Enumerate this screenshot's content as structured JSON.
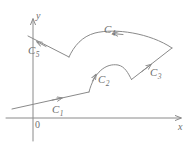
{
  "figure": {
    "kind": "math-diagram",
    "stroke_color": "#8a8a8a",
    "label_color": "#6e6e6e",
    "background_color": "#ffffff"
  },
  "axes": {
    "x_label": "x",
    "y_label": "y",
    "origin_label": "0",
    "x_axis": {
      "y": 118,
      "x_start": 6,
      "x_end": 184,
      "arrow": "right"
    },
    "y_axis": {
      "x": 33,
      "y_start": 140,
      "y_end": 16,
      "arrow": "up"
    }
  },
  "curves": [
    {
      "id": "C1",
      "label": "C",
      "subscript": "1",
      "shape": "line",
      "arrow_direction": "right",
      "points": [
        [
          12,
          108
        ],
        [
          89,
          92
        ]
      ]
    },
    {
      "id": "C2",
      "label": "C",
      "subscript": "2",
      "shape": "arc",
      "arrow_direction": "right",
      "points": [
        [
          89,
          92
        ],
        [
          103,
          66
        ],
        [
          123,
          64
        ],
        [
          131,
          79
        ]
      ]
    },
    {
      "id": "C3",
      "label": "C",
      "subscript": "3",
      "shape": "line",
      "arrow_direction": "up-right",
      "points": [
        [
          131,
          79
        ],
        [
          172,
          48
        ]
      ]
    },
    {
      "id": "C4",
      "label": "C",
      "subscript": "4",
      "shape": "arc",
      "arrow_direction": "left",
      "points": [
        [
          172,
          48
        ],
        [
          130,
          31
        ],
        [
          90,
          33
        ],
        [
          69,
          57
        ]
      ]
    },
    {
      "id": "C5",
      "label": "C",
      "subscript": "5",
      "shape": "line",
      "arrow_direction": "up-left",
      "points": [
        [
          69,
          57
        ],
        [
          30,
          37
        ]
      ]
    }
  ]
}
